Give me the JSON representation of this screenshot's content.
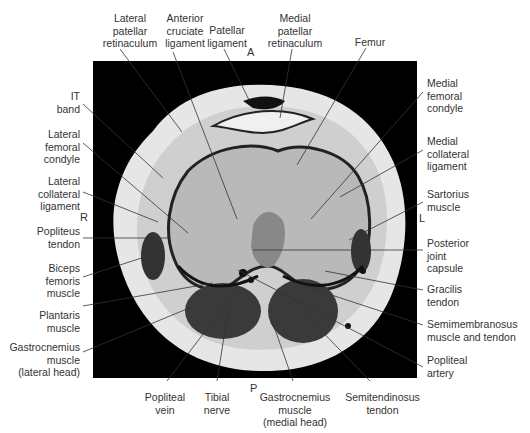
{
  "figure": {
    "type": "axial MRI of knee with anatomical labels",
    "orientation": {
      "anterior": "A",
      "posterior": "P",
      "right": "R",
      "left": "L"
    },
    "labels_top": [
      {
        "id": "lateral-patellar-retinaculum",
        "text": "Lateral\npatellar\nretinaculum"
      },
      {
        "id": "anterior-cruciate-ligament",
        "text": "Anterior\ncruciate\nligament"
      },
      {
        "id": "patellar-ligament",
        "text": "Patellar\nligament"
      },
      {
        "id": "medial-patellar-retinaculum",
        "text": "Medial\npatellar\nretinaculum"
      },
      {
        "id": "femur",
        "text": "Femur"
      }
    ],
    "labels_left": [
      {
        "id": "it-band",
        "text": "IT\nband"
      },
      {
        "id": "lateral-femoral-condyle",
        "text": "Lateral\nfemoral\ncondyle"
      },
      {
        "id": "lateral-collateral-ligament",
        "text": "Lateral\ncollateral\nligament"
      },
      {
        "id": "popliteus-tendon",
        "text": "Popliteus\ntendon"
      },
      {
        "id": "biceps-femoris-muscle",
        "text": "Biceps\nfemoris\nmuscle"
      },
      {
        "id": "plantaris-muscle",
        "text": "Plantaris\nmuscle"
      },
      {
        "id": "gastrocnemius-lateral",
        "text": "Gastrocnemius\nmuscle\n(lateral head)"
      }
    ],
    "labels_right": [
      {
        "id": "medial-femoral-condyle",
        "text": "Medial\nfemoral\ncondyle"
      },
      {
        "id": "medial-collateral-ligament",
        "text": "Medial\ncollateral\nligament"
      },
      {
        "id": "sartorius-muscle",
        "text": "Sartorius\nmuscle"
      },
      {
        "id": "posterior-joint-capsule",
        "text": "Posterior\njoint\ncapsule"
      },
      {
        "id": "gracilis-tendon",
        "text": "Gracilis\ntendon"
      },
      {
        "id": "semimembranosus",
        "text": "Semimembranosus\nmuscle and tendon"
      },
      {
        "id": "popliteal-artery",
        "text": "Popliteal\nartery"
      }
    ],
    "labels_bottom": [
      {
        "id": "popliteal-vein",
        "text": "Popliteal\nvein"
      },
      {
        "id": "tibial-nerve",
        "text": "Tibial\nnerve"
      },
      {
        "id": "gastrocnemius-medial",
        "text": "Gastrocnemius\nmuscle\n(medial head)"
      },
      {
        "id": "semitendinosus-tendon",
        "text": "Semitendinosus\ntendon"
      }
    ]
  }
}
